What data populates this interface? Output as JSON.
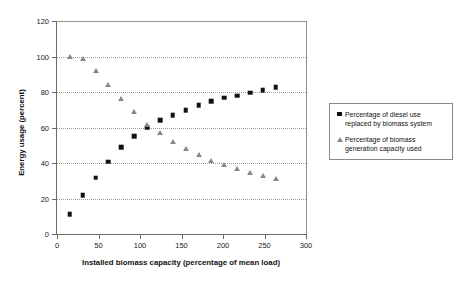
{
  "chart_data": {
    "type": "scatter",
    "title": "",
    "xlabel": "Installed biomass capacity (percentage of mean load)",
    "ylabel": "Energy usage (percent)",
    "xlim": [
      0,
      300
    ],
    "ylim": [
      0,
      120
    ],
    "xticks": [
      0,
      50,
      100,
      150,
      200,
      250,
      300
    ],
    "yticks": [
      0,
      20,
      40,
      60,
      80,
      100,
      120
    ],
    "grid": "horizontal-dotted",
    "legend_position": "right",
    "series": [
      {
        "name": "Percentage of diesel use replaced by biomass system",
        "marker": "square",
        "color": "#111111",
        "points": [
          {
            "x": 15.5,
            "y": 11
          },
          {
            "x": 31,
            "y": 21.8
          },
          {
            "x": 46.5,
            "y": 31.8
          },
          {
            "x": 62,
            "y": 40.8
          },
          {
            "x": 77.5,
            "y": 48.8
          },
          {
            "x": 93,
            "y": 55
          },
          {
            "x": 108.5,
            "y": 60
          },
          {
            "x": 124,
            "y": 64
          },
          {
            "x": 139.5,
            "y": 66.8
          },
          {
            "x": 155,
            "y": 69.8
          },
          {
            "x": 170.5,
            "y": 72.7
          },
          {
            "x": 186,
            "y": 74.8
          },
          {
            "x": 201.5,
            "y": 76.8
          },
          {
            "x": 217,
            "y": 77.8
          },
          {
            "x": 232.5,
            "y": 79.7
          },
          {
            "x": 248,
            "y": 81
          },
          {
            "x": 263.5,
            "y": 82.8
          }
        ]
      },
      {
        "name": "Percentage of biomass generation capacity used",
        "marker": "triangle",
        "color": "#888888",
        "points": [
          {
            "x": 15.5,
            "y": 100
          },
          {
            "x": 31,
            "y": 98.5
          },
          {
            "x": 46.5,
            "y": 91.8
          },
          {
            "x": 62,
            "y": 84
          },
          {
            "x": 77.5,
            "y": 75.8
          },
          {
            "x": 93,
            "y": 68.6
          },
          {
            "x": 108.5,
            "y": 61.3
          },
          {
            "x": 124,
            "y": 56.7
          },
          {
            "x": 139.5,
            "y": 52
          },
          {
            "x": 155,
            "y": 48
          },
          {
            "x": 170.5,
            "y": 44.4
          },
          {
            "x": 186,
            "y": 41.3
          },
          {
            "x": 201.5,
            "y": 38.7
          },
          {
            "x": 217,
            "y": 36.5
          },
          {
            "x": 232.5,
            "y": 34.3
          },
          {
            "x": 248,
            "y": 32.4
          },
          {
            "x": 263.5,
            "y": 30.8
          }
        ]
      }
    ]
  },
  "legend": {
    "entries": [
      {
        "label": "Percentage of diesel use replaced by biomass system",
        "marker": "square"
      },
      {
        "label": "Percentage of biomass generation capacity used",
        "marker": "triangle"
      }
    ]
  }
}
